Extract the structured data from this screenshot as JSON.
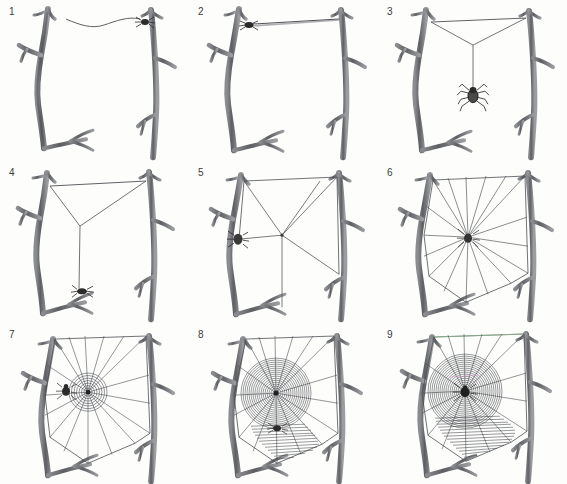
{
  "figure": {
    "background_color": "#fdfdfc",
    "branch_color": "#6f7175",
    "branch_dark": "#4a4c50",
    "silk_color": "#5a5c60",
    "spider_color": "#2b2b2b",
    "number_color": "#3a3a3a",
    "columns": 3,
    "rows": 3
  },
  "panels": [
    {
      "number": "1",
      "caption": "Spider releases a drifting bridge line of silk toward the far branch",
      "elements": [
        "left-branch",
        "right-branch",
        "floating-bridge-thread",
        "spider-on-right-branch"
      ]
    },
    {
      "number": "2",
      "caption": "Bridge line is anchored and drawn taut between the two branches",
      "elements": [
        "left-branch",
        "right-branch",
        "taut-bridge-thread",
        "spider-on-left-anchor"
      ]
    },
    {
      "number": "3",
      "caption": "Spider drops a vertical thread from the middle of the bridge forming a Y",
      "elements": [
        "left-branch",
        "right-branch",
        "bridge-thread",
        "y-fork-threads",
        "dropline",
        "hanging-spider"
      ]
    },
    {
      "number": "4",
      "caption": "The Y hub is fixed and the dropline is anchored to the lower branch",
      "elements": [
        "left-branch",
        "right-branch",
        "bridge-thread",
        "y-fork-threads",
        "anchored-dropline",
        "spider-at-bottom-anchor"
      ]
    },
    {
      "number": "5",
      "caption": "Additional frame threads and the first radii are laid from the hub",
      "elements": [
        "left-branch",
        "right-branch",
        "frame-threads",
        "first-radii",
        "hub",
        "spider-on-left-branch"
      ]
    },
    {
      "number": "6",
      "caption": "A full set of radial spokes runs from the hub to the outer frame",
      "elements": [
        "left-branch",
        "right-branch",
        "frame-threads",
        "radii",
        "hub",
        "spider-at-hub"
      ]
    },
    {
      "number": "7",
      "caption": "Spider spins the temporary auxiliary spiral outward from the hub",
      "elements": [
        "left-branch",
        "right-branch",
        "frame-threads",
        "radii",
        "auxiliary-spiral",
        "spider-near-hub"
      ]
    },
    {
      "number": "8",
      "caption": "The sticky capture spiral is laid inward, replacing the auxiliary spiral",
      "elements": [
        "left-branch",
        "right-branch",
        "frame-threads",
        "radii",
        "capture-spiral",
        "spider-on-spiral"
      ]
    },
    {
      "number": "9",
      "caption": "Completed orb web with the spider resting at the hub",
      "elements": [
        "left-branch",
        "right-branch",
        "frame-threads",
        "radii",
        "complete-capture-spiral",
        "spider-at-hub"
      ]
    }
  ]
}
